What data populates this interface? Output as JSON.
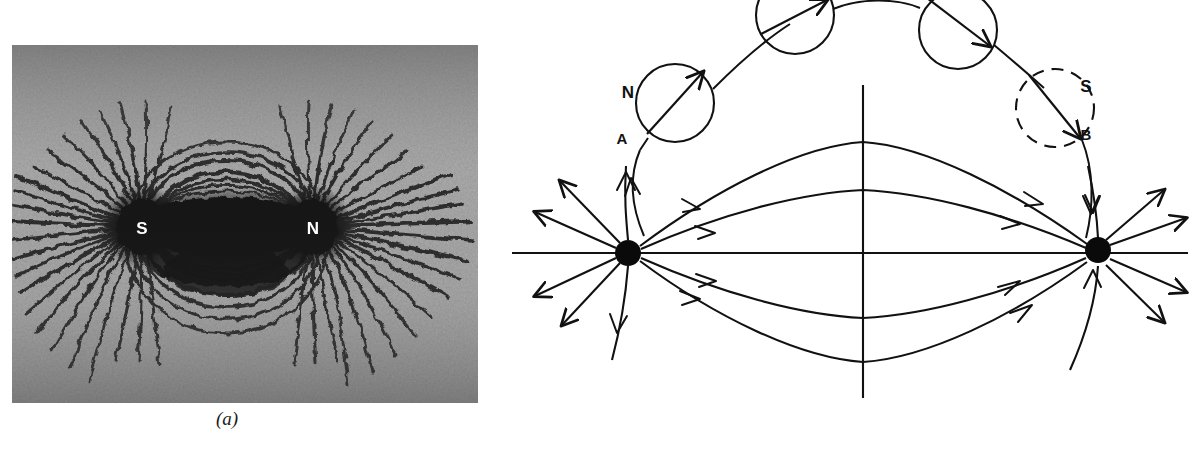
{
  "figure": {
    "panels": [
      {
        "id": "a",
        "caption": "(a)",
        "type": "photograph",
        "description": "Iron filings pattern around a bar magnet",
        "pole_labels": [
          {
            "text": "S",
            "x": 142,
            "y": 233
          },
          {
            "text": "N",
            "x": 305,
            "y": 233
          }
        ]
      },
      {
        "id": "b",
        "caption": "(b)",
        "type": "line-diagram",
        "description": "Magnetic field lines between two poles with compass needle positions",
        "pole_labels": [
          {
            "text": "N",
            "x": 128,
            "y": 98
          },
          {
            "text": "A",
            "x": 122,
            "y": 144
          },
          {
            "text": "S",
            "x": 586,
            "y": 92
          },
          {
            "text": "B",
            "x": 586,
            "y": 140
          }
        ]
      }
    ]
  },
  "colors": {
    "ink": "#111111",
    "background": "#ffffff",
    "label_on_dark": "#ffffff"
  },
  "geometry": {
    "pole_a": {
      "cx": 128,
      "cy": 253,
      "r": 13
    },
    "pole_b": {
      "cx": 598,
      "cy": 250,
      "r": 13
    },
    "axis_horizontal": {
      "x1": 12,
      "y1": 253,
      "x2": 688,
      "y2": 253
    },
    "axis_vertical": {
      "x": 363,
      "y1": 85,
      "y2": 398
    },
    "compass_circles": [
      {
        "cx": 175,
        "cy": 103,
        "r": 39,
        "style": "solid"
      },
      {
        "cx": 295,
        "cy": 15,
        "r": 39,
        "style": "solid"
      },
      {
        "cx": 458,
        "cy": 30,
        "r": 39,
        "style": "solid"
      },
      {
        "cx": 555,
        "cy": 108,
        "r": 39,
        "style": "dashed"
      }
    ]
  }
}
